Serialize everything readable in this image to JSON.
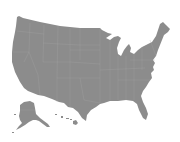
{
  "map": {
    "title": "",
    "type": "silhouette",
    "region": "United States",
    "colors": {
      "land": "#8c8c8c",
      "border": "#a6a6a6",
      "background": "#ffffff"
    },
    "shapes": [
      {
        "id": "contiguous-us",
        "label": ""
      },
      {
        "id": "alaska",
        "label": ""
      },
      {
        "id": "hawaii",
        "label": ""
      }
    ]
  }
}
